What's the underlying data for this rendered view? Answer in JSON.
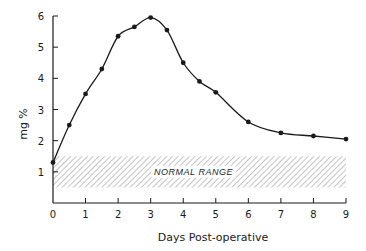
{
  "chart_data": {
    "type": "line",
    "title": "",
    "xlabel": "Days Post-operative",
    "ylabel": "mg %",
    "xlim": [
      0,
      9
    ],
    "ylim": [
      0,
      6
    ],
    "x_ticks": [
      0,
      1,
      2,
      3,
      4,
      5,
      6,
      7,
      8,
      9
    ],
    "y_ticks": [
      1,
      2,
      3,
      4,
      5,
      6
    ],
    "grid": false,
    "series": [
      {
        "name": "mg %",
        "x": [
          0,
          0.5,
          1,
          1.5,
          2,
          2.5,
          3,
          3.5,
          4,
          4.5,
          5,
          6,
          7,
          8,
          9
        ],
        "values": [
          1.3,
          2.5,
          3.5,
          4.3,
          5.35,
          5.65,
          5.95,
          5.55,
          4.5,
          3.9,
          3.55,
          2.6,
          2.25,
          2.15,
          2.05
        ],
        "marker": "circle",
        "smooth": true
      }
    ],
    "annotations": [
      {
        "type": "band",
        "label": "NORMAL RANGE",
        "y_from": 0.5,
        "y_to": 1.5,
        "x_from": 0,
        "x_to": 9,
        "fill": "hatched"
      }
    ]
  },
  "labels": {
    "xlabel": "Days Post-operative",
    "ylabel": "mg %",
    "band": "NORMAL RANGE"
  },
  "colors": {
    "line": "#1a1a1a",
    "hatch": "#8a8a8a",
    "background": "#ffffff"
  }
}
